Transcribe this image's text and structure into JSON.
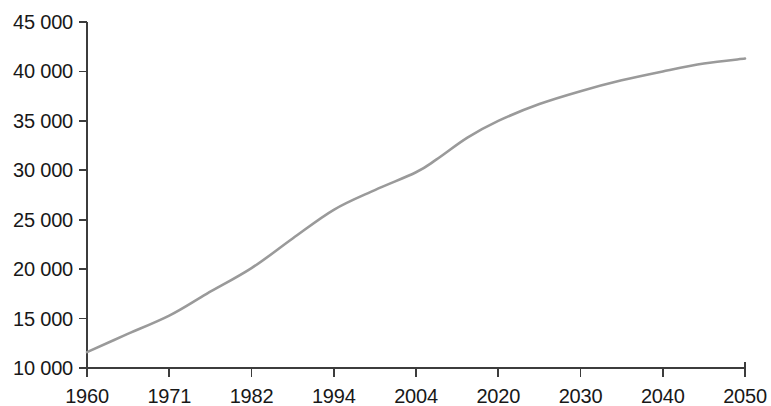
{
  "chart_data": {
    "type": "line",
    "title": "",
    "subtitle": "",
    "xlabel": "",
    "ylabel": "",
    "categories": [
      "1960",
      "1971",
      "1982",
      "1994",
      "2004",
      "2020",
      "2030",
      "2040",
      "2050"
    ],
    "values": [
      11600,
      15300,
      20100,
      26000,
      29800,
      35000,
      38000,
      40000,
      41300
    ],
    "series": [
      {
        "name": "Population",
        "values": [
          11600,
          15300,
          20100,
          26000,
          29800,
          35000,
          38000,
          40000,
          41300
        ]
      }
    ],
    "detail_points": [
      {
        "x": "1960",
        "y": 11600
      },
      {
        "x": "1965",
        "y": 13300
      },
      {
        "x": "1971",
        "y": 15300
      },
      {
        "x": "1976",
        "y": 17500
      },
      {
        "x": "1982",
        "y": 20100
      },
      {
        "x": "1988",
        "y": 23100
      },
      {
        "x": "1994",
        "y": 26000
      },
      {
        "x": "1999",
        "y": 28000
      },
      {
        "x": "2004",
        "y": 29800
      },
      {
        "x": "2008",
        "y": 31100
      },
      {
        "x": "2014",
        "y": 33300
      },
      {
        "x": "2020",
        "y": 35000
      },
      {
        "x": "2025",
        "y": 36700
      },
      {
        "x": "2030",
        "y": 38000
      },
      {
        "x": "2035",
        "y": 39100
      },
      {
        "x": "2040",
        "y": 40000
      },
      {
        "x": "2045",
        "y": 40800
      },
      {
        "x": "2050",
        "y": 41300
      }
    ],
    "y_ticks": [
      "10 000",
      "15 000",
      "20 000",
      "25 000",
      "30 000",
      "35 000",
      "40 000",
      "45 000"
    ],
    "y_tick_values": [
      10000,
      15000,
      20000,
      25000,
      30000,
      35000,
      40000,
      45000
    ],
    "ylim": [
      10000,
      45000
    ],
    "x_axis_type": "categorical",
    "grid": false,
    "legend": "none",
    "line_color": "#9a9a9a",
    "axis_color": "#3c3c3c",
    "text_color": "#181818"
  }
}
